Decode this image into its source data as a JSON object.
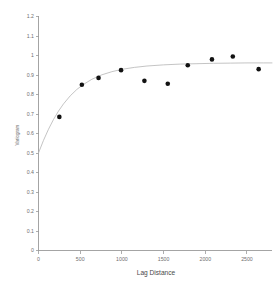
{
  "chart_data": {
    "type": "scatter",
    "title": "",
    "xlabel": "Lag Distance",
    "ylabel": "Variogram",
    "xlim": [
      0,
      2800
    ],
    "ylim": [
      0,
      1.2
    ],
    "grid": false,
    "legend": null,
    "xticks": [
      0,
      500,
      1000,
      1500,
      2000,
      2500
    ],
    "xtick_labels": [
      "0",
      "500",
      "1000",
      "1500",
      "2000",
      "2500"
    ],
    "yticks": [
      0,
      0.1,
      0.2,
      0.3,
      0.4,
      0.5,
      0.6,
      0.7,
      0.8,
      0.9,
      1.0,
      1.1,
      1.2
    ],
    "ytick_labels": [
      "0",
      "0.1",
      "0.2",
      "0.3",
      "0.4",
      "0.5",
      "0.6",
      "0.7",
      "0.8",
      "0.9",
      "1",
      "1.1",
      "1.2"
    ],
    "series": [
      {
        "name": "Experimental variogram",
        "type": "scatter",
        "marker": "filled-circle",
        "color": "#121212",
        "x": [
          250,
          520,
          720,
          990,
          1270,
          1550,
          1790,
          2080,
          2330,
          2640
        ],
        "y": [
          0.685,
          0.85,
          0.885,
          0.925,
          0.87,
          0.855,
          0.95,
          0.98,
          0.995,
          0.93
        ]
      },
      {
        "name": "Fitted model",
        "type": "line",
        "color": "#b9b9b9",
        "x": [
          0,
          60,
          120,
          180,
          240,
          300,
          380,
          460,
          540,
          640,
          760,
          880,
          1000,
          1150,
          1300,
          1500,
          1700,
          1900,
          2100,
          2300,
          2500,
          2700,
          2800
        ],
        "y": [
          0.5,
          0.565,
          0.622,
          0.672,
          0.715,
          0.752,
          0.793,
          0.826,
          0.852,
          0.878,
          0.901,
          0.917,
          0.929,
          0.939,
          0.946,
          0.952,
          0.956,
          0.958,
          0.96,
          0.961,
          0.962,
          0.962,
          0.962
        ]
      }
    ]
  },
  "axes": {
    "x_axis_title": "Lag Distance",
    "y_axis_title": "Variogram"
  }
}
